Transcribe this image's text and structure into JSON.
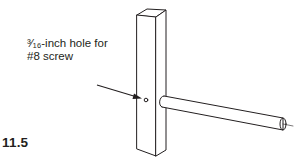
{
  "figure": {
    "number": "11.5",
    "callout": {
      "line1_fraction": "³⁄₁₆",
      "line1_text": "-inch hole for",
      "line2_text": "#8 screw"
    },
    "parts": [
      "post",
      "hole",
      "dowel",
      "pointer-arrow",
      "centerline"
    ],
    "colors": {
      "line": "#231f20",
      "background": "#ffffff"
    }
  }
}
